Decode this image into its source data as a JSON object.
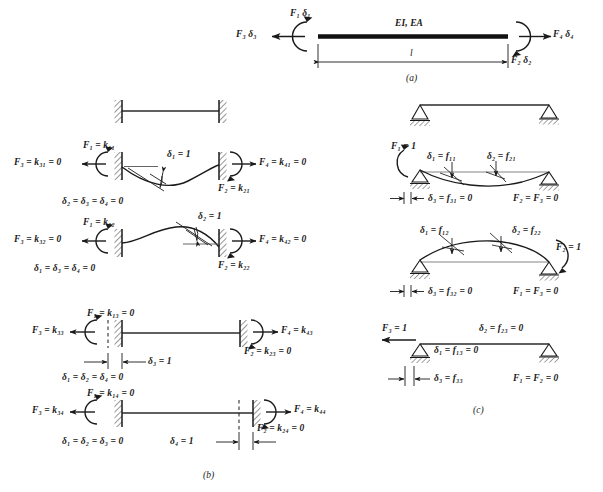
{
  "figure": {
    "type": "structural-beam-stiffness-flexibility-diagram",
    "panels": [
      "a",
      "b",
      "c"
    ]
  },
  "panel_a": {
    "tag": "(a)",
    "member_label": "EI, EA",
    "length_label": "l",
    "forces": {
      "f1d1": "F₁ δ₁",
      "f3d3": "F₃ δ₃",
      "f4d4": "F₄ δ₄",
      "f2d2": "F₂ δ₂"
    }
  },
  "panel_b": {
    "tag": "(b)",
    "cases": [
      {
        "id": "k1",
        "f1": "F₁ = k₁₁",
        "f3": "F₃ = k₃₁ = 0",
        "f4": "F₄ = k₄₁ = 0",
        "f2": "F₂ = k₂₁",
        "unit": "δ₁ = 1",
        "zeros": "δ₂ = δ₃ = δ₄ = 0"
      },
      {
        "id": "k2",
        "f1": "F₁ = k₁₂",
        "f3": "F₃ = k₃₂ = 0",
        "f4": "F₄ = k₄₂ = 0",
        "f2": "F₂ = k₂₂",
        "unit": "δ₂ = 1",
        "zeros": "δ₁ = δ₃ = δ₄ = 0"
      },
      {
        "id": "k3",
        "f1": "F₁ = k₁₃ = 0",
        "f3": "F₃ = k₃₃",
        "f4": "F₄ = k₄₃",
        "f2": "F₂ = k₂₃ = 0",
        "unit": "δ₃ = 1",
        "zeros": "δ₁ = δ₂ = δ₄ = 0"
      },
      {
        "id": "k4",
        "f1": "F₁ = k₁₄ = 0",
        "f3": "F₃ = k₃₄",
        "f4": "F₄ = k₄₄",
        "f2": "F₂ = k₂₄ = 0",
        "unit": "δ₄ = 1",
        "zeros": "δ₁ = δ₂ = δ₃ = 0"
      }
    ]
  },
  "panel_c": {
    "tag": "(c)",
    "cases": [
      {
        "id": "f1",
        "load": "F₁ = 1",
        "d1": "δ₁ = f₁₁",
        "d2": "δ₂ = f₂₁",
        "d3": "δ₃ = f₃₁ = 0",
        "zeros": "F₂ = F₃ = 0"
      },
      {
        "id": "f2",
        "load": "F₂ = 1",
        "d1": "δ₁ = f₁₂",
        "d2": "δ₂ = f₂₂",
        "d3": "δ₃ = f₃₂ = 0",
        "zeros": "F₁ = F₃ = 0"
      },
      {
        "id": "f3",
        "load": "F₃ = 1",
        "d1": "δ₁ = f₁₃ = 0",
        "d2": "δ₂ = f₂₃ = 0",
        "d3": "δ₃ = f₃₃",
        "zeros": "F₁ = F₂ = 0"
      }
    ]
  },
  "colors": {
    "ink": "#1a1a1a",
    "line": "#2b2b2b",
    "background": "#ffffff"
  }
}
